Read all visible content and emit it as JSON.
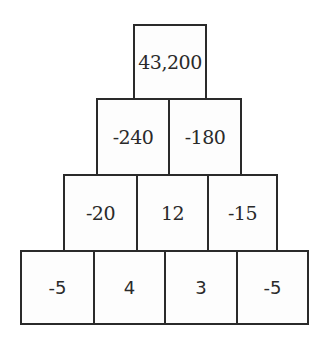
{
  "pyramid": {
    "rows": [
      [
        "43,200"
      ],
      [
        "-240",
        "-180"
      ],
      [
        "-20",
        "12",
        "-15"
      ],
      [
        "-5",
        "4",
        "3",
        "-5"
      ]
    ]
  }
}
